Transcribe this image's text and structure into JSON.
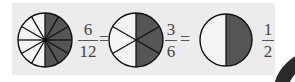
{
  "diagram": {
    "colors": {
      "shaded": "#555555",
      "unshaded": "#f4f4f4",
      "background": "#ececec",
      "stroke": "#111111"
    },
    "circles": [
      {
        "name": "twelfths-circle",
        "sectors": 12,
        "shaded": 6
      },
      {
        "name": "sixths-circle",
        "sectors": 6,
        "shaded": 3
      },
      {
        "name": "halves-circle",
        "sectors": 2,
        "shaded": 1
      }
    ],
    "fractions": [
      {
        "numerator": "6",
        "denominator": "12"
      },
      {
        "numerator": "3",
        "denominator": "6"
      },
      {
        "numerator": "1",
        "denominator": "2"
      }
    ],
    "equals": [
      "=",
      "="
    ]
  }
}
